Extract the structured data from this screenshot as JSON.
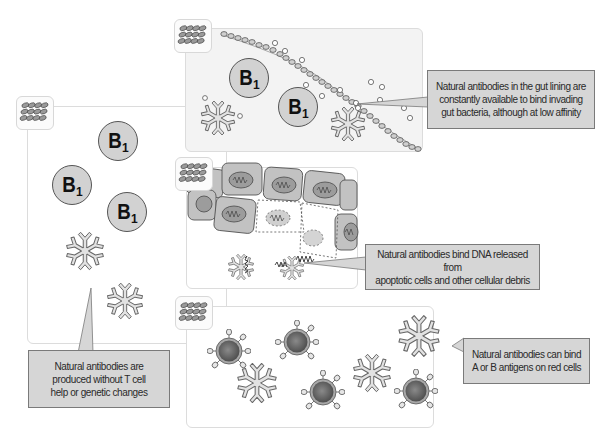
{
  "diagram": {
    "colors": {
      "background": "#ffffff",
      "panel_tint": "#f3f3f3",
      "callout_fill": "#d6d6d6",
      "callout_border": "#7a7a7a",
      "cell_fill": "#d2d2d2",
      "antibody_fill": "#e0e0e0",
      "red_cell_center": "#6e6e6e"
    },
    "panels": {
      "origin": {
        "b1_cells": [
          {
            "label": "B",
            "subscript": "1"
          },
          {
            "label": "B",
            "subscript": "1"
          },
          {
            "label": "B",
            "subscript": "1"
          }
        ],
        "icon": "antibody-cluster-icon",
        "callout": {
          "lines": [
            "Natural antibodies are",
            "produced without T cell",
            "help or genetic changes"
          ]
        }
      },
      "gut": {
        "b1_cells": [
          {
            "label": "B",
            "subscript": "1"
          },
          {
            "label": "B",
            "subscript": "1"
          }
        ],
        "icon": "antibody-cluster-icon",
        "callout": {
          "lines": [
            "Natural antibodies in the gut lining are",
            "constantly available to bind invading",
            "gut bacteria, although at low affinity"
          ]
        }
      },
      "dna": {
        "icon": "antibody-cluster-icon",
        "callout": {
          "lines": [
            "Natural antibodies bind DNA released from",
            "apoptotic cells and other cellular debris"
          ]
        }
      },
      "red_cells": {
        "icon": "antibody-cluster-icon",
        "callout": {
          "lines": [
            "Natural antibodies can bind",
            "A or B antigens on red cells"
          ]
        }
      }
    }
  }
}
